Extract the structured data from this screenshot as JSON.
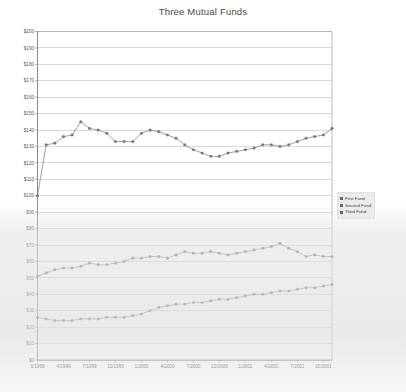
{
  "chart_data": {
    "type": "line",
    "title": "Three Mutual Funds",
    "xlabel": "",
    "ylabel": "",
    "ylim": [
      0,
      200
    ],
    "ytick_step": 10,
    "grid": true,
    "legend_position": "right",
    "y_ticks": [
      "$200",
      "$190",
      "$180",
      "$170",
      "$160",
      "$150",
      "$140",
      "$130",
      "$120",
      "$110",
      "$100",
      "$90",
      "$80",
      "$70",
      "$60",
      "$50",
      "$40",
      "$30",
      "$20",
      "$10",
      "$0"
    ],
    "x_ticks": [
      "1/1999",
      "4/1999",
      "7/1999",
      "10/1999",
      "1/2000",
      "4/2000",
      "7/2000",
      "10/2000",
      "1/2001",
      "4/2001",
      "7/2001",
      "10/2001"
    ],
    "x": [
      "1/1999",
      "2/1999",
      "3/1999",
      "4/1999",
      "5/1999",
      "6/1999",
      "7/1999",
      "8/1999",
      "9/1999",
      "10/1999",
      "11/1999",
      "12/1999",
      "1/2000",
      "2/2000",
      "3/2000",
      "4/2000",
      "5/2000",
      "6/2000",
      "7/2000",
      "8/2000",
      "9/2000",
      "10/2000",
      "11/2000",
      "12/2000",
      "1/2001",
      "2/2001",
      "3/2001",
      "4/2001",
      "5/2001",
      "6/2001",
      "7/2001",
      "8/2001",
      "9/2001",
      "10/2001",
      "11/2001"
    ],
    "series": [
      {
        "name": "First Fund",
        "color": "#7a7068",
        "values": [
          100,
          131,
          132,
          136,
          137,
          145,
          141,
          140,
          138,
          133,
          133,
          133,
          138,
          140,
          139,
          137,
          135,
          131,
          128,
          126,
          124,
          124,
          126,
          127,
          128,
          129,
          131,
          131,
          130,
          131,
          133,
          135,
          136,
          137,
          141
        ]
      },
      {
        "name": "Second Fund",
        "color": "#7a7068",
        "values": [
          51,
          53,
          55,
          56,
          56,
          57,
          59,
          58,
          58,
          59,
          60,
          62,
          62,
          63,
          63,
          62,
          64,
          66,
          65,
          65,
          66,
          65,
          64,
          65,
          66,
          67,
          68,
          69,
          71,
          68,
          66,
          63,
          64,
          63,
          63
        ]
      },
      {
        "name": "Third Fund",
        "color": "#7a7068",
        "values": [
          26,
          25,
          24,
          24,
          24,
          25,
          25,
          25,
          26,
          26,
          26,
          27,
          28,
          30,
          32,
          33,
          34,
          34,
          35,
          35,
          36,
          37,
          37,
          38,
          39,
          40,
          40,
          41,
          42,
          42,
          43,
          44,
          44,
          45,
          46
        ]
      }
    ]
  },
  "legend": {
    "items": [
      {
        "label": "First Fund",
        "color": "#6e675f"
      },
      {
        "label": "Second Fund",
        "color": "#6e675f"
      },
      {
        "label": "Third Fund",
        "color": "#6e675f"
      }
    ]
  }
}
